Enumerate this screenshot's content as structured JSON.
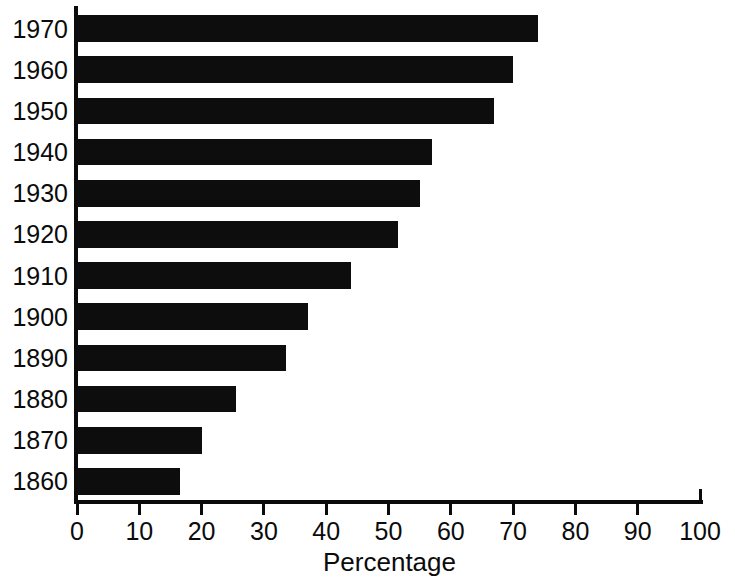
{
  "chart_data": {
    "type": "bar",
    "orientation": "horizontal",
    "title": "",
    "subtitle": "",
    "xlabel": "Percentage",
    "ylabel": "",
    "categories": [
      "1970",
      "1960",
      "1950",
      "1940",
      "1930",
      "1920",
      "1910",
      "1900",
      "1890",
      "1880",
      "1870",
      "1860"
    ],
    "values": [
      74,
      70,
      67,
      57,
      55,
      51.5,
      44,
      37,
      33.5,
      25.5,
      20,
      16.5
    ],
    "series": [
      {
        "name": "Percentage",
        "values": [
          74,
          70,
          67,
          57,
          55,
          51.5,
          44,
          37,
          33.5,
          25.5,
          20,
          16.5
        ]
      }
    ],
    "xlim": [
      0,
      100
    ],
    "xticks": [
      0,
      10,
      20,
      30,
      40,
      50,
      60,
      70,
      80,
      90,
      100
    ],
    "xtick_labels": [
      "0",
      "10",
      "20",
      "30",
      "40",
      "50",
      "60",
      "70",
      "80",
      "90",
      "100"
    ],
    "ytick_labels": [
      "1970",
      "1960",
      "1950",
      "1940",
      "1930",
      "1920",
      "1910",
      "1900",
      "1890",
      "1880",
      "1870",
      "1860"
    ],
    "grid": false,
    "legend": false,
    "legend_position": "none",
    "annotations": [],
    "bar_color": "#0d0d0d",
    "axis_color": "#0b0b0b",
    "background_color": "#ffffff"
  },
  "axis": {
    "x_title": "Percentage"
  }
}
